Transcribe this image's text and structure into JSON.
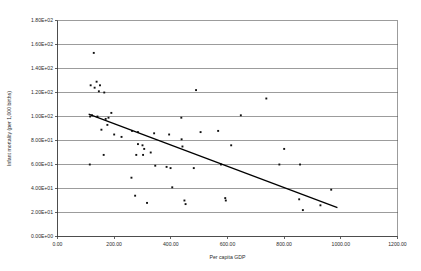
{
  "chart_data": {
    "type": "scatter",
    "title": "",
    "xlabel": "Per capita GDP",
    "ylabel": "Infant mortality (per 1,000 births)",
    "xlim": [
      0,
      1200
    ],
    "ylim": [
      0,
      180
    ],
    "grid": true,
    "legend": false,
    "x_ticks": [
      0,
      200,
      400,
      600,
      800,
      1000,
      1200
    ],
    "x_tick_labels": [
      "0.00",
      "200.00",
      "400.00",
      "600.00",
      "800.00",
      "1000.00",
      "1200.00"
    ],
    "y_ticks": [
      0,
      20,
      40,
      60,
      80,
      100,
      120,
      140,
      160,
      180
    ],
    "y_tick_labels": [
      "0.00E+00",
      "2.00E+01",
      "4.00E+01",
      "6.00E+01",
      "8.00E+01",
      "1.00E+02",
      "1.20E+02",
      "1.40E+02",
      "1.60E+02",
      "1.80E+02"
    ],
    "series": [
      {
        "name": "Countries",
        "marker": "filled-square",
        "color": "#111111",
        "points": [
          [
            128,
            153
          ],
          [
            117,
            126
          ],
          [
            131,
            124
          ],
          [
            138,
            129
          ],
          [
            146,
            121
          ],
          [
            165,
            120
          ],
          [
            180,
            99
          ],
          [
            150,
            126
          ],
          [
            489,
            122
          ],
          [
            737,
            115
          ],
          [
            115,
            100
          ],
          [
            122,
            101
          ],
          [
            141,
            100
          ],
          [
            170,
            98
          ],
          [
            190,
            103
          ],
          [
            176,
            93
          ],
          [
            200,
            85
          ],
          [
            263,
            88
          ],
          [
            437,
            99
          ],
          [
            647,
            101
          ],
          [
            155,
            89
          ],
          [
            226,
            83
          ],
          [
            284,
            87
          ],
          [
            341,
            86
          ],
          [
            394,
            85
          ],
          [
            505,
            87
          ],
          [
            567,
            88
          ],
          [
            438,
            81
          ],
          [
            284,
            77
          ],
          [
            300,
            76
          ],
          [
            306,
            73
          ],
          [
            163,
            68
          ],
          [
            278,
            68
          ],
          [
            302,
            68
          ],
          [
            329,
            70
          ],
          [
            441,
            75
          ],
          [
            613,
            76
          ],
          [
            800,
            73
          ],
          [
            114,
            60
          ],
          [
            345,
            59
          ],
          [
            385,
            58
          ],
          [
            399,
            57
          ],
          [
            481,
            57
          ],
          [
            577,
            60
          ],
          [
            783,
            60
          ],
          [
            856,
            60
          ],
          [
            261,
            49
          ],
          [
            405,
            41
          ],
          [
            966,
            39
          ],
          [
            274,
            34
          ],
          [
            448,
            30
          ],
          [
            452,
            27
          ],
          [
            592,
            32
          ],
          [
            594,
            30
          ],
          [
            853,
            31
          ],
          [
            316,
            28
          ],
          [
            928,
            26
          ],
          [
            866,
            22
          ]
        ]
      }
    ],
    "trendline": {
      "name": "Linear trend",
      "x_start": 110,
      "y_start": 102,
      "x_end": 988,
      "y_end": 24,
      "color": "#000000"
    }
  }
}
